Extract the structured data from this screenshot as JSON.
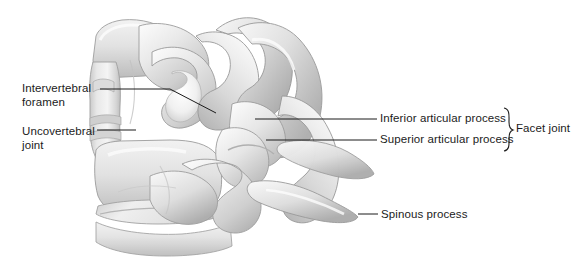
{
  "figure": {
    "background_color": "#ffffff",
    "width": 581,
    "height": 270
  },
  "labels": {
    "intervertebral_foramen": "Intervertebral\nforamen",
    "uncovertebral_joint": "Uncovertebral\njoint",
    "inferior_articular_process": "Inferior articular process",
    "superior_articular_process": "Superior articular process",
    "spinous_process": "Spinous process",
    "facet_joint": "Facet joint"
  },
  "style": {
    "text_color": "#1b1b1b",
    "leader_color": "#1b1b1b",
    "bone_light": "#f6f6f6",
    "bone_mid": "#d8d8d8",
    "bone_shadow": "#a8a8a8",
    "bone_outline": "#9a9a9a"
  },
  "leaders": [
    {
      "name": "intervertebral-foramen-leader",
      "points": "100,89 170,89 216,113"
    },
    {
      "name": "uncovertebral-joint-leader",
      "points": "97,130 136,130"
    },
    {
      "name": "inferior-articular-process-leader",
      "points": "255,119 377,119"
    },
    {
      "name": "superior-articular-process-leader",
      "points": "266,140 377,140"
    },
    {
      "name": "spinous-process-leader",
      "points": "358,214 378,214"
    }
  ],
  "brace": {
    "name": "facet-joint-brace",
    "top": 108,
    "bottom": 151,
    "x": 504
  }
}
